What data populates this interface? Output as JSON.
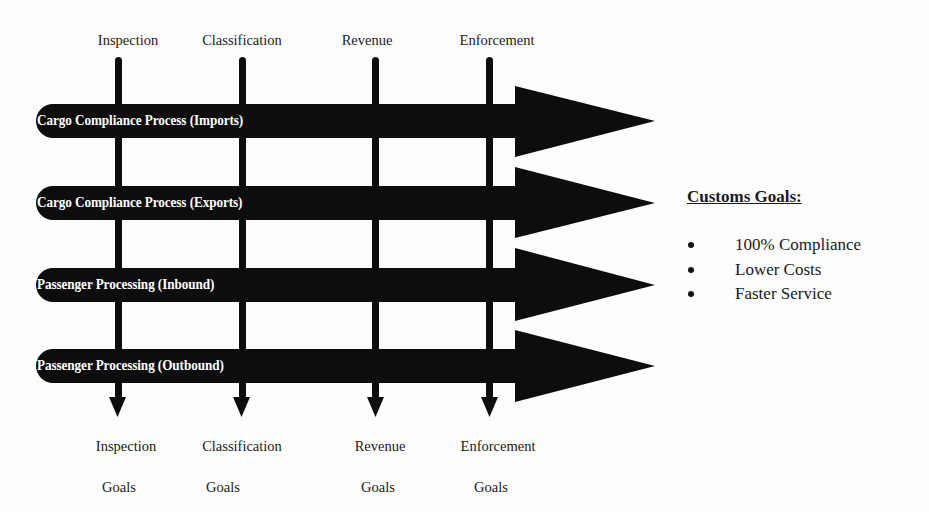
{
  "columns": [
    {
      "id": "inspection",
      "top_label": "Inspection",
      "bottom_label_line1": "Inspection",
      "bottom_label_line2": "Goals",
      "x": 118
    },
    {
      "id": "classification",
      "top_label": "Classification",
      "bottom_label_line1": "Classification",
      "bottom_label_line2": "Goals",
      "x": 242
    },
    {
      "id": "revenue",
      "top_label": "Revenue",
      "bottom_label_line1": "Revenue",
      "bottom_label_line2": "Goals",
      "x": 376
    },
    {
      "id": "enforcement",
      "top_label": "Enforcement",
      "bottom_label_line1": "Enforcement",
      "bottom_label_line2": "Goals",
      "x": 490
    }
  ],
  "processes": [
    {
      "label": "Cargo Compliance Process (Imports)",
      "center_y": 121
    },
    {
      "label": "Cargo Compliance Process (Exports)",
      "center_y": 203
    },
    {
      "label": "Passenger Processing (Inbound)",
      "center_y": 285
    },
    {
      "label": "Passenger Processing (Outbound)",
      "center_y": 366
    }
  ],
  "customs_goals": {
    "title": "Customs Goals:",
    "items": [
      "100% Compliance",
      "Lower Costs",
      "Faster Service"
    ]
  },
  "colors": {
    "arrow_fill": "#0d0d0d",
    "background": "#fdfdfd",
    "arrow_text": "#ffffff"
  }
}
